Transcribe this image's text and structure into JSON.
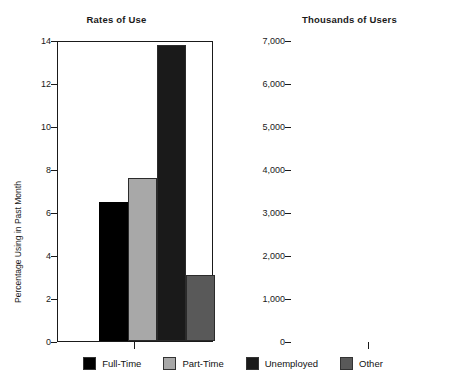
{
  "chart_data": [
    {
      "type": "bar",
      "title": "Rates of Use",
      "xlabel": "",
      "ylabel": "Percentage Using in Past Month",
      "categories": [
        "Full-Time",
        "Part-Time",
        "Unemployed",
        "Other"
      ],
      "values": [
        6.45,
        7.6,
        13.75,
        3.05
      ],
      "ylim": [
        0,
        14
      ],
      "yticks": [
        0,
        2,
        4,
        6,
        8,
        10,
        12,
        14
      ],
      "ytick_labels": [
        "0",
        "2",
        "4",
        "6",
        "8",
        "10",
        "12",
        "14"
      ],
      "grid": false,
      "legend_position": "bottom"
    },
    {
      "type": "bar",
      "title": "Thousands of Users",
      "xlabel": "",
      "ylabel": "",
      "categories": [
        "Full-Time",
        "Part-Time",
        "Unemployed",
        "Other"
      ],
      "values": [
        6800,
        1600,
        1180,
        1860
      ],
      "ylim": [
        0,
        7000
      ],
      "yticks": [
        0,
        1000,
        2000,
        3000,
        4000,
        5000,
        6000,
        7000
      ],
      "ytick_labels": [
        "0",
        "1,000",
        "2,000",
        "3,000",
        "4,000",
        "5,000",
        "6,000",
        "7,000"
      ],
      "grid": false,
      "legend_position": "bottom"
    }
  ],
  "legend": {
    "items": [
      {
        "label": "Full-Time",
        "color": "#000000"
      },
      {
        "label": "Part-Time",
        "color": "#a8a8a8"
      },
      {
        "label": "Unemployed",
        "color": "#1a1a1a"
      },
      {
        "label": "Other",
        "color": "#595959"
      }
    ]
  },
  "series_colors": [
    "#000000",
    "#a8a8a8",
    "#1a1a1a",
    "#595959"
  ]
}
